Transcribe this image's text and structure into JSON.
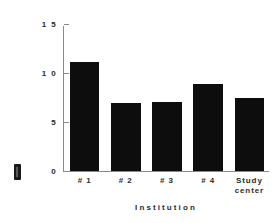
{
  "chart_data": {
    "type": "bar",
    "title": "",
    "subtitle": "",
    "xlabel": "Institution",
    "ylabel": "",
    "categories": [
      "# 1",
      "# 2",
      "# 3",
      "# 4",
      "Study\ncenter"
    ],
    "values": [
      11.1,
      6.9,
      7.0,
      8.9,
      7.5
    ],
    "ylim": [
      0,
      15
    ],
    "yticks": [
      "0",
      "5",
      "1 0",
      "1 5"
    ],
    "ytick_values": [
      0,
      5,
      10,
      15
    ],
    "grid": false,
    "legend": false,
    "legend_position": "none",
    "bar_color": "#0d0d0d",
    "axis_color": "#8a8a8a",
    "background_color": "#ffffff",
    "text_color": "#2b2b2b"
  },
  "axes": {
    "y_tick_labels": [
      "1 5",
      "1 0",
      "5",
      "0"
    ],
    "x_tick_labels": [
      "# 1",
      "# 2",
      "# 3",
      "# 4",
      "Study\ncenter"
    ],
    "x_axis_title": "Institution"
  },
  "artifacts": {
    "cropped_y_label": "y-axis-label-clipped"
  }
}
